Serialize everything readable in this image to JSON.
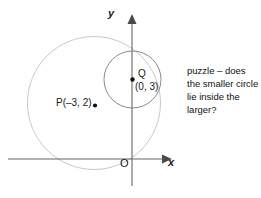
{
  "figure": {
    "type": "coordinate-geometry-diagram",
    "width": 261,
    "height": 198,
    "background_color": "#ffffff"
  },
  "axes": {
    "x_axis_label": "x",
    "y_axis_label": "y",
    "origin_label": "O",
    "axis_color": "#666666",
    "arrowheads": [
      "x-positive",
      "y-positive"
    ],
    "x_axis_y_px": 159,
    "y_axis_x_px": 132
  },
  "circles": [
    {
      "name": "larger-circle",
      "center_label": "P(–3, 2)",
      "stroke_color": "#c9c9c9",
      "cx_px": 94,
      "cy_px": 103,
      "r_px": 66.5
    },
    {
      "name": "smaller-circle",
      "center_label": "Q (0, 3)",
      "stroke_color": "#8a8a8a",
      "cx_px": 132.5,
      "cy_px": 79.5,
      "r_px": 28.5
    }
  ],
  "points": [
    {
      "name": "point-p",
      "label": "P(–3, 2)",
      "coordinates": "(–3, 2)",
      "x_px": 95,
      "y_px": 105,
      "dot_color": "#111111"
    },
    {
      "name": "point-q",
      "label": "Q",
      "coordinates": "(0, 3)",
      "x_px": 132.5,
      "y_px": 79.5,
      "dot_color": "#111111"
    }
  ],
  "caption": {
    "text": "puzzle – does the smaller circle lie inside the larger?",
    "color": "#111111"
  }
}
